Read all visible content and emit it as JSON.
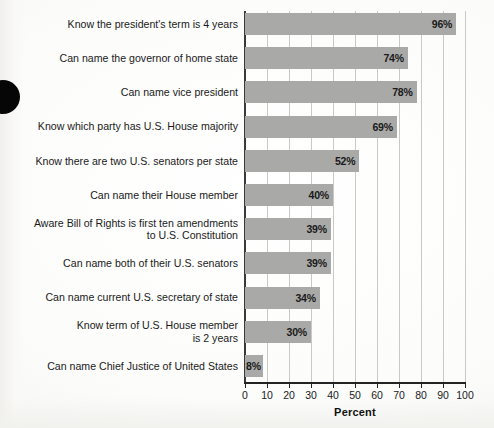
{
  "chart_data": {
    "type": "bar",
    "orientation": "horizontal",
    "title": "",
    "xlabel": "Percent",
    "ylabel": "",
    "xlim": [
      0,
      100
    ],
    "xticks": [
      0,
      10,
      20,
      30,
      40,
      50,
      60,
      70,
      80,
      90,
      100
    ],
    "grid": "vertical",
    "legend": "none",
    "bar_color": "#a9a9a7",
    "categories": [
      "Know the president's term is 4 years",
      "Can name the governor of home state",
      "Can name vice president",
      "Know which party has U.S. House majority",
      "Know there are two U.S. senators per state",
      "Can name their House member",
      "Aware Bill of Rights is first ten amendments\nto U.S. Constitution",
      "Can name both of their U.S. senators",
      "Can name current U.S. secretary of state",
      "Know term of U.S. House member\nis 2 years",
      "Can name Chief Justice of United States"
    ],
    "values": [
      96,
      74,
      78,
      69,
      52,
      40,
      39,
      39,
      34,
      30,
      8
    ],
    "value_labels": [
      "96%",
      "74%",
      "78%",
      "69%",
      "52%",
      "40%",
      "39%",
      "39%",
      "34%",
      "30%",
      "8%"
    ]
  }
}
